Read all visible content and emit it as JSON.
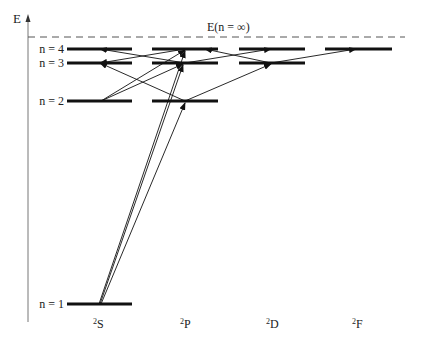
{
  "axis": {
    "label": "E",
    "limit_label": "E(n = ∞)"
  },
  "levels": {
    "n_labels": [
      "n = 4",
      "n = 3",
      "n = 2",
      "n = 1"
    ],
    "terms": [
      {
        "sup": "2",
        "letter": "S"
      },
      {
        "sup": "2",
        "letter": "P"
      },
      {
        "sup": "2",
        "letter": "D"
      },
      {
        "sup": "2",
        "letter": "F"
      }
    ],
    "structure": {
      "S": [
        1,
        2,
        3,
        4
      ],
      "P": [
        2,
        3,
        4
      ],
      "D": [
        3,
        4
      ],
      "F": [
        4
      ]
    }
  },
  "transitions": [
    {
      "from": "1S",
      "to": "2P"
    },
    {
      "from": "1S",
      "to": "3P"
    },
    {
      "from": "1S",
      "to": "4P"
    },
    {
      "from": "2S",
      "to": "3P"
    },
    {
      "from": "2S",
      "to": "4P"
    },
    {
      "from": "2P",
      "to": "3S"
    },
    {
      "from": "3P",
      "to": "4S"
    },
    {
      "from": "4P",
      "to": "3S"
    },
    {
      "from": "2P",
      "to": "3D"
    },
    {
      "from": "3P",
      "to": "4D"
    },
    {
      "from": "3D",
      "to": "4P"
    },
    {
      "from": "3D",
      "to": "4F"
    }
  ],
  "colors": {
    "line": "#111111",
    "dashed": "#555555",
    "axis": "#777777"
  }
}
